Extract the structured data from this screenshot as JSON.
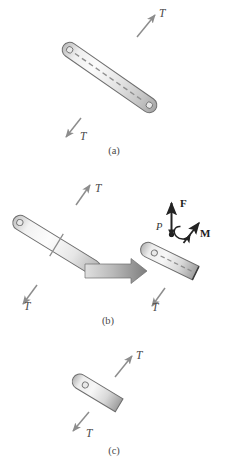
{
  "figure": {
    "background_color": "#ffffff",
    "bar_fill_light": "#f4f4f4",
    "bar_fill_mid": "#d9d9d9",
    "bar_fill_dark": "#a8a8a8",
    "bar_stroke": "#6e6e6e",
    "arrow_color": "#8a8a8a",
    "block_arrow_light": "#d7d7d7",
    "block_arrow_dark": "#7b7b7b",
    "label_color": "#3a3a3a"
  },
  "panels": [
    {
      "id": "a",
      "caption": "(a)",
      "caption_x": 113,
      "caption_y": 152,
      "description": "Two-force member in tension with dashed centerline",
      "labels": [
        {
          "name": "tension-top",
          "text": "T",
          "x": 159,
          "y": 14
        },
        {
          "name": "tension-bottom",
          "text": "T",
          "x": 80,
          "y": 137
        }
      ]
    },
    {
      "id": "b",
      "caption": "(b)",
      "caption_x": 107,
      "caption_y": 322,
      "description": "Bar cut at a section; block arrow leads to free-body of upper part showing resultant force F and moment M at point P",
      "labels": [
        {
          "name": "tension-top",
          "text": "T",
          "x": 75,
          "y": 190
        },
        {
          "name": "tension-bottom",
          "text": "T",
          "x": 24,
          "y": 301
        },
        {
          "name": "force-resultant",
          "text": "F",
          "x": 184,
          "y": 203
        },
        {
          "name": "moment-resultant",
          "text": "M",
          "x": 203,
          "y": 234
        },
        {
          "name": "section-point",
          "text": "P",
          "x": 157,
          "y": 226
        },
        {
          "name": "tension-bottom-right",
          "text": "T",
          "x": 152,
          "y": 305
        }
      ]
    },
    {
      "id": "c",
      "caption": "(c)",
      "caption_x": 113,
      "caption_y": 452,
      "description": "Shortened bar segment in tension",
      "labels": [
        {
          "name": "tension-top",
          "text": "T",
          "x": 138,
          "y": 356
        },
        {
          "name": "tension-bottom",
          "text": "T",
          "x": 86,
          "y": 434
        }
      ]
    }
  ],
  "symbols": {
    "tension": "T",
    "force_vector": "F",
    "moment_vector": "M",
    "section_point": "P"
  }
}
